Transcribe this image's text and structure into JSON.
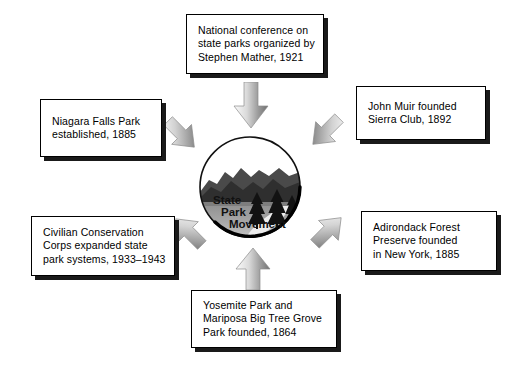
{
  "diagram": {
    "center": {
      "emblem_name": "state-park-emblem",
      "label_lines": [
        "State",
        "Park",
        "Movement"
      ],
      "label_full": "State Park Movement",
      "scenery": [
        "mountains",
        "lake",
        "pine-trees",
        "sky"
      ]
    },
    "boxes": [
      {
        "id": "mather",
        "text": "National conference on\nstate parks organized by\nStephen Mather, 1921",
        "position": "top"
      },
      {
        "id": "niagara",
        "text": "Niagara Falls Park\nestablished, 1885",
        "position": "top-left"
      },
      {
        "id": "muir",
        "text": "John Muir founded\nSierra Club, 1892",
        "position": "top-right"
      },
      {
        "id": "ccc",
        "text": "Civilian Conservation\nCorps expanded state\npark systems, 1933–1943",
        "position": "bottom-left"
      },
      {
        "id": "adirondack",
        "text": "Adirondack Forest\nPreserve founded\nin New York, 1885",
        "position": "bottom-right"
      },
      {
        "id": "yosemite",
        "text": "Yosemite Park and\nMariposa Big Tree Grove\nPark founded, 1864",
        "position": "bottom"
      }
    ],
    "arrows": [
      {
        "id": "arrow-down-from-mather",
        "direction": "down",
        "from": "mather",
        "to": "center"
      },
      {
        "id": "arrow-downright-from-niagara",
        "direction": "down-right",
        "from": "niagara",
        "to": "center"
      },
      {
        "id": "arrow-downleft-from-muir",
        "direction": "down-left",
        "from": "muir",
        "to": "center"
      },
      {
        "id": "arrow-upright-from-ccc",
        "direction": "up-right",
        "from": "ccc",
        "to": "center"
      },
      {
        "id": "arrow-upleft-from-adirondack",
        "direction": "up-left",
        "from": "adirondack",
        "to": "center"
      },
      {
        "id": "arrow-up-from-yosemite",
        "direction": "up",
        "from": "yosemite",
        "to": "center"
      }
    ],
    "colors": {
      "background": "#ffffff",
      "box_fill": "#ffffff",
      "box_border": "#000000",
      "box_shadow": "#1a1a1a",
      "arrow_light": "#f2f2f2",
      "arrow_mid": "#b8b8b8",
      "arrow_dark": "#7a7a7a",
      "emblem_sky": "#ffffff",
      "emblem_mountain": "#3d3d3d",
      "emblem_water": "#9e9e9e",
      "emblem_tree": "#1a1a1a",
      "text": "#000000"
    }
  }
}
